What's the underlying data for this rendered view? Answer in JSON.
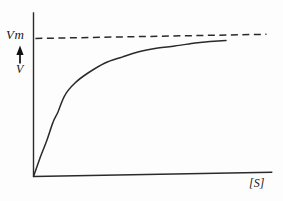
{
  "figure": {
    "background": "#fdfdfd",
    "description_visible_text_only": ""
  },
  "chart_data": {
    "type": "line",
    "title": "",
    "xlabel": "[S]",
    "ylabel": "V",
    "grid": false,
    "legend": false,
    "x_axis": {
      "label": "[S]",
      "ticks": [],
      "range_units": [
        0,
        102.5
      ]
    },
    "y_axis": {
      "label": "V",
      "ticks": [],
      "range_frac_of_Vm": [
        0,
        1.19
      ]
    },
    "asymptote": {
      "label": "Vm",
      "y_frac": 1.0,
      "style": "dashed",
      "x_start": 0.8,
      "x_end": 100
    },
    "series": [
      {
        "name": "reaction-velocity-vs-substrate",
        "style": "solid",
        "points": [
          [
            0,
            0
          ],
          [
            2.8,
            0.133
          ],
          [
            5.8,
            0.263
          ],
          [
            8.4,
            0.392
          ],
          [
            10.5,
            0.464
          ],
          [
            13.5,
            0.586
          ],
          [
            17.8,
            0.672
          ],
          [
            23.4,
            0.743
          ],
          [
            30.7,
            0.813
          ],
          [
            38.0,
            0.854
          ],
          [
            44.8,
            0.889
          ],
          [
            53.4,
            0.915
          ],
          [
            60.7,
            0.927
          ],
          [
            69.3,
            0.946
          ],
          [
            75.8,
            0.955
          ],
          [
            82.6,
            0.96
          ]
        ]
      }
    ],
    "colors": {
      "line": "#2a2a2a",
      "text": "#161616"
    }
  }
}
